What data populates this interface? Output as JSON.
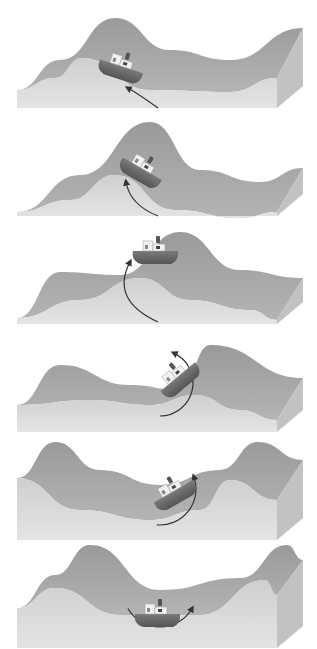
{
  "diagram": {
    "title": "",
    "colors": {
      "background": "#ffffff",
      "top_surface": "#9a9a9a",
      "top_surface_light": "#b4b4b4",
      "front_face": "#e4e4e4",
      "front_face_dark": "#cfcfcf",
      "side_face": "#c2c2c2",
      "hull": "#7a7a7a",
      "hull_dark": "#555555",
      "cabin": "#f2f2f2",
      "arrow": "#333333"
    },
    "panels": [
      {
        "id": 1,
        "top": 0,
        "back": [
          [
            17,
            90
          ],
          [
            60,
            60
          ],
          [
            115,
            18
          ],
          [
            170,
            50
          ],
          [
            230,
            60
          ],
          [
            303,
            28
          ]
        ],
        "front": [
          [
            17,
            90
          ],
          [
            55,
            78
          ],
          [
            82,
            58
          ],
          [
            150,
            90
          ],
          [
            230,
            92
          ],
          [
            277,
            78
          ]
        ],
        "boat": {
          "x": 120,
          "y": 70,
          "angle": 18
        },
        "arrow": {
          "d": "M158 108 Q140 95 128 88",
          "head": [
            128,
            88
          ]
        }
      },
      {
        "id": 2,
        "top": 108,
        "back": [
          [
            17,
            212
          ],
          [
            80,
            175
          ],
          [
            150,
            122
          ],
          [
            200,
            170
          ],
          [
            260,
            182
          ],
          [
            303,
            168
          ]
        ],
        "front": [
          [
            17,
            212
          ],
          [
            70,
            200
          ],
          [
            115,
            175
          ],
          [
            175,
            210
          ],
          [
            240,
            218
          ],
          [
            277,
            212
          ]
        ],
        "boat": {
          "x": 140,
          "y": 172,
          "angle": 30
        },
        "arrow": {
          "d": "M158 216 Q130 205 126 182",
          "head": [
            126,
            182
          ]
        }
      },
      {
        "id": 3,
        "top": 216,
        "back": [
          [
            17,
            318
          ],
          [
            60,
            272
          ],
          [
            120,
            275
          ],
          [
            180,
            232
          ],
          [
            240,
            270
          ],
          [
            303,
            278
          ]
        ],
        "front": [
          [
            17,
            318
          ],
          [
            80,
            300
          ],
          [
            140,
            278
          ],
          [
            190,
            300
          ],
          [
            250,
            310
          ],
          [
            277,
            320
          ]
        ],
        "boat": {
          "x": 155,
          "y": 255,
          "angle": 0
        },
        "arrow": {
          "d": "M158 322 Q110 300 130 262",
          "head": [
            130,
            262
          ]
        }
      },
      {
        "id": 4,
        "top": 324,
        "back": [
          [
            17,
            405
          ],
          [
            60,
            365
          ],
          [
            130,
            385
          ],
          [
            180,
            390
          ],
          [
            210,
            345
          ],
          [
            303,
            378
          ]
        ],
        "front": [
          [
            17,
            405
          ],
          [
            90,
            400
          ],
          [
            150,
            405
          ],
          [
            195,
            395
          ],
          [
            240,
            410
          ],
          [
            277,
            420
          ]
        ],
        "boat": {
          "x": 180,
          "y": 380,
          "angle": -40
        },
        "arrow": {
          "type": "arc",
          "cx": 160,
          "cy": 383,
          "r": 33,
          "start": 90,
          "end": -65
        }
      },
      {
        "id": 5,
        "top": 432,
        "back": [
          [
            17,
            478
          ],
          [
            55,
            442
          ],
          [
            100,
            470
          ],
          [
            160,
            485
          ],
          [
            220,
            470
          ],
          [
            258,
            442
          ],
          [
            303,
            460
          ]
        ],
        "front": [
          [
            17,
            478
          ],
          [
            80,
            510
          ],
          [
            150,
            520
          ],
          [
            200,
            510
          ],
          [
            230,
            480
          ],
          [
            277,
            500
          ]
        ],
        "boat": {
          "x": 175,
          "y": 495,
          "angle": -30
        },
        "arrow": {
          "type": "arc",
          "cx": 160,
          "cy": 489,
          "r": 36,
          "start": 95,
          "end": -20
        }
      },
      {
        "id": 6,
        "top": 540,
        "back": [
          [
            17,
            608
          ],
          [
            55,
            575
          ],
          [
            90,
            545
          ],
          [
            160,
            590
          ],
          [
            240,
            578
          ],
          [
            287,
            545
          ],
          [
            303,
            560
          ]
        ],
        "front": [
          [
            17,
            608
          ],
          [
            55,
            588
          ],
          [
            120,
            615
          ],
          [
            200,
            615
          ],
          [
            265,
            580
          ],
          [
            277,
            595
          ]
        ],
        "boat": {
          "x": 157,
          "y": 618,
          "angle": 0
        },
        "arrow": {
          "type": "arc",
          "cx": 160,
          "cy": 590,
          "r": 37,
          "start": 150,
          "end": 30
        }
      }
    ]
  }
}
